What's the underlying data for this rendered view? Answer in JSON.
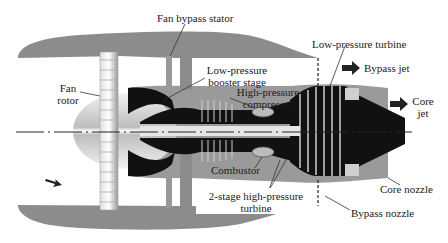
{
  "diagram": {
    "type": "turbofan engine cross-section",
    "labels": {
      "fan_bypass_stator": "Fan bypass stator",
      "fan_rotor_line1": "Fan",
      "fan_rotor_line2": "rotor",
      "lp_booster_line1": "Low-pressure",
      "lp_booster_line2": "booster stage",
      "hp_compressor_line1": "High-pressure",
      "hp_compressor_line2": "compressor",
      "lp_turbine": "Low-pressure turbine",
      "bypass_jet": "Bypass jet",
      "core_jet_line1": "Core",
      "core_jet_line2": "jet",
      "combustor": "Combustor",
      "hp_turbine_line1": "2-stage high-pressure",
      "hp_turbine_line2": "turbine",
      "core_nozzle": "Core nozzle",
      "bypass_nozzle": "Bypass nozzle"
    },
    "colors": {
      "nacelle": "#8c8c8c",
      "core_casing": "#9a9a9a",
      "blades_dark": "#111111",
      "blade_light": "#d9d9d9",
      "background": "#ffffff",
      "text": "#1a1a1a"
    }
  }
}
